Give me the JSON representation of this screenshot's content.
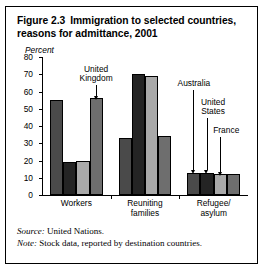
{
  "figure": {
    "number": "Figure 2.3",
    "title": "Immigration to selected countries, reasons for admittance, 2001",
    "source_label": "Source:",
    "source_text": " United Nations.",
    "note_label": "Note:",
    "note_text": " Stock data, reported by destination countries."
  },
  "chart_data": {
    "type": "bar",
    "xlabel": "",
    "ylabel": "Percent",
    "ylim": [
      0,
      80
    ],
    "yticks": [
      0,
      10,
      20,
      30,
      40,
      50,
      60,
      70,
      80
    ],
    "grid": false,
    "legend": "annotated-arrows",
    "categories": [
      "Workers",
      "Reuniting\nfamilies",
      "Refugee/\nasylum"
    ],
    "series": [
      {
        "name": "Australia",
        "color": "#4a4a4a",
        "values": [
          55,
          33,
          13
        ]
      },
      {
        "name": "United States",
        "color": "#242424",
        "values": [
          19,
          70,
          13
        ]
      },
      {
        "name": "France",
        "color": "#a9a9a9",
        "values": [
          20,
          69,
          12
        ]
      },
      {
        "name": "United Kingdom",
        "color": "#6e6e6e",
        "values": [
          56,
          34,
          12
        ]
      }
    ],
    "annotations": [
      {
        "text": "United\nKingdom",
        "series": "United Kingdom",
        "category": "Workers"
      },
      {
        "text": "Australia",
        "series": "Australia",
        "category": "Refugee/asylum"
      },
      {
        "text": "United\nStates",
        "series": "United States",
        "category": "Refugee/asylum"
      },
      {
        "text": "France",
        "series": "France",
        "category": "Refugee/asylum"
      }
    ]
  },
  "axis": {
    "ytick_labels": [
      "80",
      "70",
      "60",
      "50",
      "40",
      "30",
      "20",
      "10",
      "0"
    ],
    "percent_label": "Percent"
  },
  "groups": [
    {
      "label": "Workers"
    },
    {
      "label": "Reuniting\nfamilies"
    },
    {
      "label": "Refugee/\nasylum"
    }
  ],
  "annotations": {
    "uk": "United\nKingdom",
    "australia": "Australia",
    "us": "United\nStates",
    "france": "France"
  }
}
